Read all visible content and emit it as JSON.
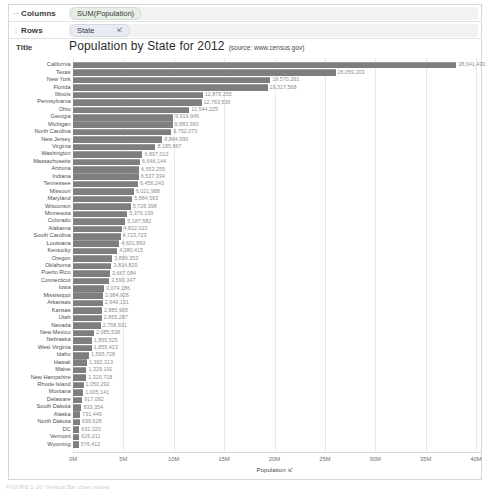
{
  "shelves": {
    "columns": {
      "grip_icon": "grip-dots-icon",
      "label": "Columns",
      "pill": "SUM(Population)"
    },
    "rows": {
      "grip_icon": "grip-dots-icon",
      "label": "Rows",
      "pill": "State",
      "sort_icon": "sort-descending-icon"
    }
  },
  "title": {
    "label": "Title",
    "main": "Population by State for 2012",
    "sub": "(source: www.census.gov)"
  },
  "axis": {
    "title": "Population",
    "sort_icon": "sort-descending-icon",
    "ticks": [
      "0M",
      "5M",
      "10M",
      "15M",
      "20M",
      "25M",
      "30M",
      "35M",
      "40M"
    ]
  },
  "caption": "FIGURE 1-10: Vertical Bar chart sorted",
  "colors": {
    "bar": "#7e7e7e",
    "bar_top": "#9b9b9b",
    "gridline": "#e9e9e9",
    "value_text": "#8e8e8e",
    "label_text": "#4d4d4d",
    "panel_border": "#d6d6d6"
  },
  "chart_data": {
    "type": "bar",
    "orientation": "horizontal",
    "title": "Population by State for 2012 (source: www.census.gov)",
    "xlabel": "Population",
    "ylabel": "State",
    "xlim": [
      0,
      40000000
    ],
    "xticks": [
      0,
      5000000,
      10000000,
      15000000,
      20000000,
      25000000,
      30000000,
      35000000,
      40000000
    ],
    "xticklabels": [
      "0M",
      "5M",
      "10M",
      "15M",
      "20M",
      "25M",
      "30M",
      "35M",
      "40M"
    ],
    "grid": true,
    "legend": false,
    "sorted": "descending",
    "measure": "SUM(Population)",
    "categories": [
      "California",
      "Texas",
      "New York",
      "Florida",
      "Illinois",
      "Pennsylvania",
      "Ohio",
      "Georgia",
      "Michigan",
      "North Carolina",
      "New Jersey",
      "Virginia",
      "Washington",
      "Massachusetts",
      "Arizona",
      "Indiana",
      "Tennessee",
      "Missouri",
      "Maryland",
      "Wisconsin",
      "Minnesota",
      "Colorado",
      "Alabama",
      "South Carolina",
      "Louisiana",
      "Kentucky",
      "Oregon",
      "Oklahoma",
      "Puerto Rico",
      "Connecticut",
      "Iowa",
      "Mississippi",
      "Arkansas",
      "Kansas",
      "Utah",
      "Nevada",
      "New Mexico",
      "Nebraska",
      "West Virginia",
      "Idaho",
      "Hawaii",
      "Maine",
      "New Hampshire",
      "Rhode Island",
      "Montana",
      "Delaware",
      "South Dakota",
      "Alaska",
      "North Dakota",
      "DC",
      "Vermont",
      "Wyoming"
    ],
    "values": [
      38041430,
      26059203,
      19570261,
      19317568,
      12875255,
      12763536,
      11544225,
      9919945,
      9883360,
      9752073,
      8864590,
      8185867,
      6897012,
      6646144,
      6553255,
      6537334,
      6456243,
      6021988,
      5884563,
      5726398,
      5379139,
      5187582,
      4822023,
      4723723,
      4601893,
      4380415,
      3899353,
      3814820,
      3667084,
      3590347,
      3074186,
      2984926,
      2949131,
      2885905,
      2855287,
      2758931,
      2085538,
      1855525,
      1855413,
      1595728,
      1392313,
      1329192,
      1320718,
      1050292,
      1005141,
      917092,
      833354,
      731449,
      699628,
      632323,
      626011,
      576412
    ],
    "value_labels": [
      "38,041,430",
      "26,059,203",
      "19,570,261",
      "19,317,568",
      "12,875,255",
      "12,763,536",
      "11,544,225",
      "9,919,945",
      "9,883,360",
      "9,752,073",
      "8,864,590",
      "8,185,867",
      "6,897,012",
      "6,646,144",
      "6,553,255",
      "6,537,334",
      "6,456,243",
      "6,021,988",
      "5,884,563",
      "5,726,398",
      "5,379,139",
      "5,187,582",
      "4,822,023",
      "4,723,723",
      "4,601,893",
      "4,380,415",
      "3,899,353",
      "3,814,820",
      "3,667,084",
      "3,590,347",
      "3,074,186",
      "2,984,926",
      "2,949,131",
      "2,885,905",
      "2,855,287",
      "2,758,931",
      "2,085,538",
      "1,855,525",
      "1,855,413",
      "1,595,728",
      "1,392,313",
      "1,329,192",
      "1,320,718",
      "1,050,292",
      "1,005,141",
      "917,092",
      "833,354",
      "731,449",
      "699,628",
      "632,323",
      "626,011",
      "576,412"
    ]
  }
}
